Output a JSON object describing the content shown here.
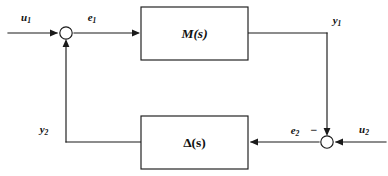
{
  "figure": {
    "kind": "control-system-block-diagram",
    "background_color": "#ffffff",
    "line_color": "#1a1a1a"
  },
  "blocks": [
    {
      "id": "m-block",
      "label_main": "M",
      "label_paren_open": "(",
      "label_var": "s",
      "label_paren_close": ")",
      "label_full": "M(s)",
      "x": 141,
      "y": 7,
      "width": 107,
      "height": 53
    },
    {
      "id": "delta-block",
      "label_main": "Δ",
      "label_paren_open": "(",
      "label_var": "s",
      "label_paren_close": ")",
      "label_full": "Δ(s)",
      "x": 141,
      "y": 116,
      "width": 107,
      "height": 53
    }
  ],
  "summing_junctions": [
    {
      "id": "left-sum",
      "cx": 66,
      "cy": 33,
      "r": 6.2
    },
    {
      "id": "right-sum",
      "cx": 327,
      "cy": 142,
      "r": 6.2
    }
  ],
  "signals": [
    {
      "id": "u1",
      "base": "u",
      "sub": "1",
      "text": "u₁",
      "x": 26,
      "y": 21
    },
    {
      "id": "e1",
      "base": "e",
      "sub": "1",
      "text": "e₁",
      "x": 92,
      "y": 21
    },
    {
      "id": "y1",
      "base": "y",
      "sub": "1",
      "text": "y₁",
      "x": 337,
      "y": 24
    },
    {
      "id": "y2",
      "base": "y",
      "sub": "2",
      "text": "y₂",
      "x": 44,
      "y": 133
    },
    {
      "id": "e2",
      "base": "e",
      "sub": "2",
      "text": "e₂",
      "x": 295,
      "y": 134
    },
    {
      "id": "u2",
      "base": "u",
      "sub": "2",
      "text": "u₂",
      "x": 364,
      "y": 133
    }
  ],
  "signs": [
    {
      "id": "minus-right-sum",
      "symbol": "−",
      "x": 314,
      "y": 134
    }
  ],
  "wires": [
    {
      "id": "u1-to-sum",
      "points": "8,33 57,33",
      "arrow_at": "57,33",
      "arrow_dir": "right"
    },
    {
      "id": "sum-to-mblock",
      "points": "74,33 138,33",
      "arrow_at": "138,33",
      "arrow_dir": "right"
    },
    {
      "id": "mblock-to-corner",
      "points": "248,33 327,33",
      "arrow_at": null,
      "arrow_dir": null
    },
    {
      "id": "corner-down-to-sum",
      "points": "327,33 327,133",
      "arrow_at": "327,133",
      "arrow_dir": "down"
    },
    {
      "id": "u2-to-sum",
      "points": "386,142 336,142",
      "arrow_at": "336,142",
      "arrow_dir": "left"
    },
    {
      "id": "sum-to-delta",
      "points": "319,142 251,142",
      "arrow_at": "251,142",
      "arrow_dir": "left"
    },
    {
      "id": "delta-to-corner",
      "points": "141,142 66,142",
      "arrow_at": null,
      "arrow_dir": null
    },
    {
      "id": "corner-up-to-sum",
      "points": "66,142 66,42",
      "arrow_at": "66,42",
      "arrow_dir": "up"
    }
  ]
}
